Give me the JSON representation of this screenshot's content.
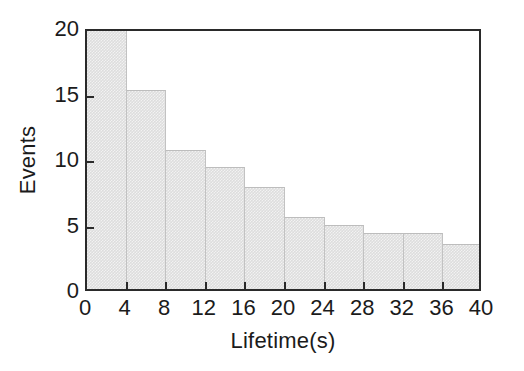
{
  "chart_data": {
    "type": "bar",
    "title": "",
    "subtitle": "",
    "xlabel": "Lifetime(s)",
    "ylabel": "Events",
    "xlim": [
      0,
      40
    ],
    "ylim": [
      0,
      20
    ],
    "xticks": [
      0,
      4,
      8,
      12,
      16,
      20,
      24,
      28,
      32,
      36,
      40
    ],
    "yticks": [
      0,
      5,
      10,
      15,
      20
    ],
    "xtick_labels": [
      "0",
      "4",
      "8",
      "12",
      "16",
      "20",
      "24",
      "28",
      "32",
      "36",
      "40"
    ],
    "ytick_labels": [
      "0",
      "5",
      "10",
      "15",
      "20"
    ],
    "grid": false,
    "legend": null,
    "bin_width": 4,
    "bin_edges": [
      0,
      4,
      8,
      12,
      16,
      20,
      24,
      28,
      32,
      36,
      40
    ],
    "categories": [
      "0-4",
      "4-8",
      "8-12",
      "12-16",
      "16-20",
      "20-24",
      "24-28",
      "28-32",
      "32-36",
      "36-40"
    ],
    "values": [
      20,
      15.2,
      10.6,
      9.3,
      7.8,
      5.5,
      4.9,
      4.3,
      4.3,
      3.4
    ],
    "bar_color": "#dddddd",
    "bar_edge_color": "#c2c2c2",
    "axis_color": "#2a2a2a",
    "background_color": "#ffffff",
    "annotations": []
  }
}
